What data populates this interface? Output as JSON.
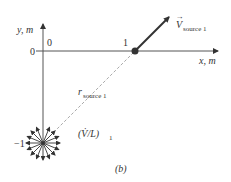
{
  "figure": {
    "caption": "(b)",
    "axes": {
      "x_label": "x, m",
      "y_label": "y, m",
      "x_origin_tick": "0",
      "y_origin_tick": "0",
      "x_tick_1": "1",
      "y_tick_neg1": "−1"
    },
    "velocity_vector": {
      "symbol": "V",
      "subscript": "source 1"
    },
    "radius": {
      "symbol": "r",
      "subscript": "source 1"
    },
    "source_strength": {
      "label": "(V̇/L)",
      "subscript": "1"
    },
    "colors": {
      "line": "#333333",
      "dashed": "#aaaaaa",
      "point": "#333333"
    }
  }
}
